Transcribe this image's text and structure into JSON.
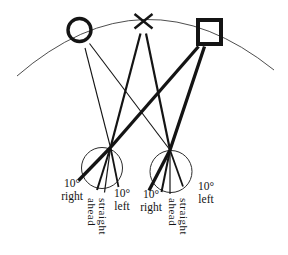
{
  "figure": {
    "background": "#ffffff",
    "ink": "#141414",
    "targets": {
      "left": "circle-target",
      "center": "cross-target",
      "right": "square-target"
    },
    "left_eye": {
      "deg_right": "10°",
      "word_right": "right",
      "straight": "straight",
      "ahead": "ahead",
      "deg_left": "10°",
      "word_left": "left"
    },
    "right_eye": {
      "deg_right": "10°",
      "word_right": "right",
      "straight": "straight",
      "ahead": "ahead",
      "deg_left": "10°",
      "word_left": "left"
    }
  }
}
